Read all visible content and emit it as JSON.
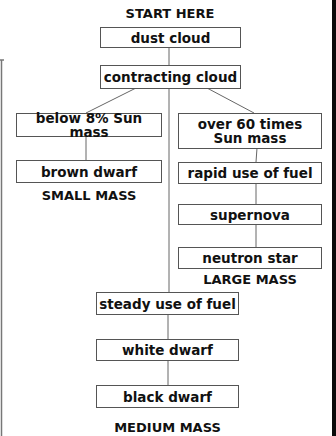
{
  "diagram": {
    "title": "START HERE",
    "nodes": {
      "dust_cloud": "dust cloud",
      "contracting_cloud": "contracting cloud",
      "below_8": "below 8% Sun mass",
      "brown_dwarf": "brown dwarf",
      "over_60": "over 60 times\nSun mass",
      "rapid_fuel": "rapid use of fuel",
      "supernova": "supernova",
      "neutron_star": "neutron star",
      "steady_fuel": "steady use of fuel",
      "white_dwarf": "white dwarf",
      "black_dwarf": "black dwarf"
    },
    "branch_labels": {
      "small": "SMALL MASS",
      "large": "LARGE MASS",
      "medium": "MEDIUM MASS"
    },
    "edges": [
      [
        "dust_cloud",
        "contracting_cloud"
      ],
      [
        "contracting_cloud",
        "below_8"
      ],
      [
        "contracting_cloud",
        "over_60"
      ],
      [
        "contracting_cloud",
        "steady_fuel"
      ],
      [
        "below_8",
        "brown_dwarf"
      ],
      [
        "over_60",
        "rapid_fuel"
      ],
      [
        "rapid_fuel",
        "supernova"
      ],
      [
        "supernova",
        "neutron_star"
      ],
      [
        "steady_fuel",
        "white_dwarf"
      ],
      [
        "white_dwarf",
        "black_dwarf"
      ]
    ],
    "colors": {
      "box_border": "#555555",
      "line": "#666666",
      "text": "#111111",
      "edge_bar": "#0a0a0a"
    }
  }
}
